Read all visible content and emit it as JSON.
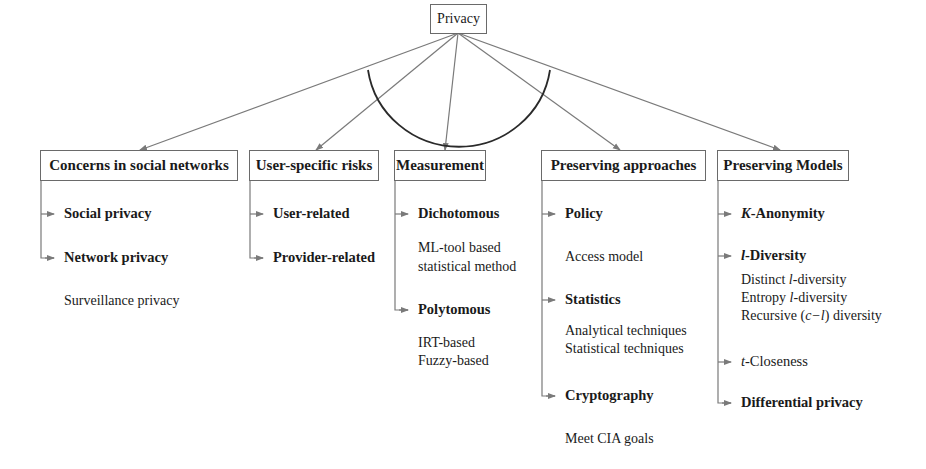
{
  "root": {
    "label": "Privacy"
  },
  "colors": {
    "line": "#7a7a7a",
    "arc": "#2a2a2a",
    "text": "#1a1a1a"
  },
  "columns": [
    {
      "title": "Concerns in social networks",
      "items": [
        {
          "label": "Social privacy",
          "details": []
        },
        {
          "label": "Network privacy",
          "details": [
            "Surveillance privacy"
          ]
        }
      ]
    },
    {
      "title": "User-specific risks",
      "items": [
        {
          "label": "User-related",
          "details": []
        },
        {
          "label": "Provider-related",
          "details": []
        }
      ]
    },
    {
      "title": "Measurement",
      "items": [
        {
          "label": "Dichotomous",
          "details": [
            "ML-tool based",
            "statistical method"
          ]
        },
        {
          "label": "Polytomous",
          "details": [
            "IRT-based",
            "Fuzzy-based"
          ]
        }
      ]
    },
    {
      "title": "Preserving approaches",
      "items": [
        {
          "label": "Policy",
          "details": [
            "Access model"
          ]
        },
        {
          "label": "Statistics",
          "details": [
            "Analytical techniques",
            "Statistical techniques"
          ]
        },
        {
          "label": "Cryptography",
          "details": [
            "Meet CIA goals"
          ]
        }
      ]
    },
    {
      "title": "Preserving Models",
      "items": [
        {
          "label_prefix": "K",
          "label": "-Anonymity",
          "details": []
        },
        {
          "label_prefix": "l",
          "label": "-Diversity",
          "details": [
            {
              "pre": "Distinct ",
              "it": "l",
              "post": "-diversity"
            },
            {
              "pre": "Entropy ",
              "it": "l",
              "post": "-diversity"
            },
            {
              "pre": "Recursive (",
              "it": "c−l",
              "post": ") diversity"
            }
          ]
        },
        {
          "label_prefix": "t",
          "label": "-Closeness",
          "details": []
        },
        {
          "label": "Differential privacy",
          "details": []
        }
      ]
    }
  ]
}
